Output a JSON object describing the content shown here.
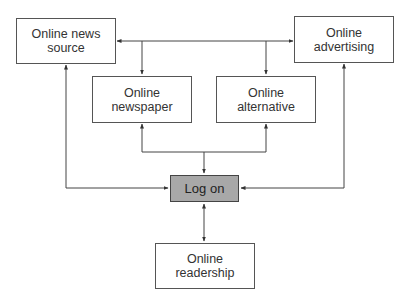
{
  "diagram": {
    "nodes": {
      "news_source": {
        "line1": "Online news",
        "line2": "source"
      },
      "advertising": {
        "line1": "Online",
        "line2": "advertising"
      },
      "newspaper": {
        "line1": "Online",
        "line2": "newspaper"
      },
      "alternative": {
        "line1": "Online",
        "line2": "alternative"
      },
      "log_on": {
        "label": "Log on"
      },
      "readership": {
        "line1": "Online",
        "line2": "readership"
      }
    },
    "edges": [
      {
        "from": "top-junction",
        "to": "news_source",
        "arrow": "to"
      },
      {
        "from": "top-junction",
        "to": "advertising",
        "arrow": "to"
      },
      {
        "from": "top-junction",
        "to": "newspaper",
        "arrow": "to"
      },
      {
        "from": "top-junction",
        "to": "alternative",
        "arrow": "to"
      },
      {
        "from": "mid-junction",
        "to": "newspaper",
        "arrow": "to"
      },
      {
        "from": "mid-junction",
        "to": "alternative",
        "arrow": "to"
      },
      {
        "from": "mid-junction",
        "to": "log_on",
        "arrow": "to"
      },
      {
        "from": "log_on-left",
        "to": "news_source",
        "arrow": "both"
      },
      {
        "from": "log_on-right",
        "to": "advertising",
        "arrow": "both"
      },
      {
        "from": "log_on",
        "to": "readership",
        "arrow": "both"
      }
    ],
    "colors": {
      "highlight_fill": "#a8a8a8",
      "line": "#444444",
      "border": "#555555"
    }
  }
}
